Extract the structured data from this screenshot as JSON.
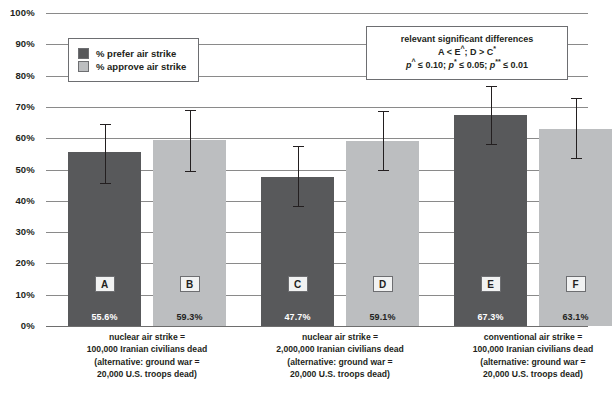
{
  "chart_data": {
    "type": "bar",
    "title": "",
    "xlabel": "",
    "ylabel": "",
    "ylim": [
      0,
      100
    ],
    "grid": true,
    "legend_position": "upper-left-inside",
    "y_ticks": [
      "100%",
      "90%",
      "80%",
      "70%",
      "60%",
      "50%",
      "40%",
      "30%",
      "20%",
      "10%",
      "0%"
    ],
    "legend": [
      {
        "key": "prefer",
        "label": "% prefer air strike",
        "color": "#58595b"
      },
      {
        "key": "approve",
        "label": "% approve air strike",
        "color": "#bcbec0"
      }
    ],
    "series": [
      {
        "name": "% prefer air strike",
        "values": [
          55.6,
          47.7,
          67.3
        ]
      },
      {
        "name": "% approve air strike",
        "values": [
          59.3,
          59.1,
          63.1
        ]
      }
    ],
    "bars": [
      {
        "letter": "A",
        "series": "prefer",
        "value": 55.6,
        "value_label": "55.6%",
        "ci_low": 45.5,
        "ci_high": 64.6,
        "group": 0
      },
      {
        "letter": "B",
        "series": "approve",
        "value": 59.3,
        "value_label": "59.3%",
        "ci_low": 49.3,
        "ci_high": 68.9,
        "group": 0
      },
      {
        "letter": "C",
        "series": "prefer",
        "value": 47.7,
        "value_label": "47.7%",
        "ci_low": 38.1,
        "ci_high": 57.4,
        "group": 1
      },
      {
        "letter": "D",
        "series": "approve",
        "value": 59.1,
        "value_label": "59.1%",
        "ci_low": 49.5,
        "ci_high": 68.7,
        "group": 1
      },
      {
        "letter": "E",
        "series": "prefer",
        "value": 67.3,
        "value_label": "67.3%",
        "ci_low": 57.8,
        "ci_high": 76.6,
        "group": 2
      },
      {
        "letter": "F",
        "series": "approve",
        "value": 63.1,
        "value_label": "63.1%",
        "ci_low": 53.2,
        "ci_high": 72.8,
        "group": 2
      }
    ],
    "categories": [
      {
        "lines": [
          "nuclear air strike =",
          "100,000 Iranian civilians dead",
          "(alternative: ground war =",
          "20,000 U.S. troops dead)"
        ]
      },
      {
        "lines": [
          "nuclear air strike =",
          "2,000,000 Iranian civilians dead",
          "(alternative: ground war =",
          "20,000 U.S. troops dead)"
        ]
      },
      {
        "lines": [
          "conventional air strike =",
          "100,000 Iranian civilians dead",
          "(alternative: ground war =",
          "20,000 U.S. troops dead)"
        ]
      }
    ],
    "annotation": {
      "line1": "relevant significant differences",
      "line2_prefix": "A < E",
      "line2_sup1": "^",
      "line2_mid": "; D > C",
      "line2_sup2": "*",
      "line3_p1": "p",
      "line3_sup1": "^",
      "line3_t1": " ≤ 0.10; ",
      "line3_p2": "p",
      "line3_sup2": "*",
      "line3_t2": " ≤ 0.05; ",
      "line3_p3": "p",
      "line3_sup3": "**",
      "line3_t3": " ≤ 0.01"
    },
    "colors": {
      "dark_bar": "#58595b",
      "light_bar": "#bcbec0",
      "gridline": "#8a8a8a",
      "text": "#231f20"
    }
  }
}
